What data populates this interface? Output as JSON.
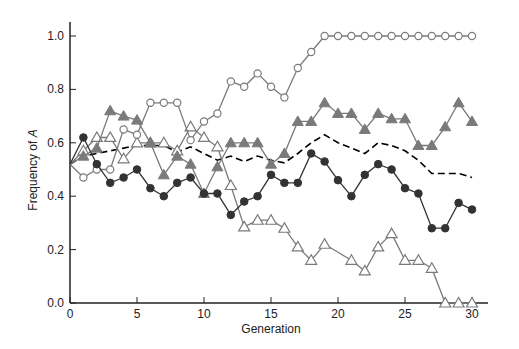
{
  "chart_data": {
    "type": "line",
    "title": "",
    "xlabel": "Generation",
    "ylabel": "Frequency of A",
    "ylabel_plain": "Frequency of ",
    "ylabel_italic": "A",
    "xlim": [
      0,
      30
    ],
    "ylim": [
      0,
      1.0
    ],
    "xticks": [
      0,
      5,
      10,
      15,
      20,
      25,
      30
    ],
    "yticks": [
      0.0,
      0.2,
      0.4,
      0.6,
      0.8,
      1.0
    ],
    "ytick_labels": [
      "0.0",
      "0.2",
      "0.4",
      "0.6",
      "0.8",
      "1.0"
    ],
    "grid": false,
    "legend": null,
    "x": [
      0,
      1,
      2,
      3,
      4,
      5,
      6,
      7,
      8,
      9,
      10,
      11,
      12,
      13,
      14,
      15,
      16,
      17,
      18,
      19,
      20,
      21,
      22,
      23,
      24,
      25,
      26,
      27,
      28,
      29,
      30
    ],
    "series": [
      {
        "name": "Population 1 (open circles)",
        "marker": "open-circle",
        "color": "#7a7a7a",
        "values": [
          0.52,
          0.47,
          0.5,
          0.5,
          0.65,
          0.63,
          0.75,
          0.75,
          0.75,
          0.61,
          0.68,
          0.71,
          0.83,
          0.81,
          0.86,
          0.81,
          0.77,
          0.88,
          0.94,
          1.0,
          1.0,
          1.0,
          1.0,
          1.0,
          1.0,
          1.0,
          1.0,
          1.0,
          1.0,
          1.0,
          1.0
        ]
      },
      {
        "name": "Population 2 (filled triangles)",
        "marker": "filled-triangle",
        "color": "#7a7a7a",
        "values": [
          0.52,
          0.55,
          0.58,
          0.72,
          0.7,
          0.685,
          0.6,
          0.48,
          0.55,
          0.52,
          0.41,
          0.51,
          0.6,
          0.6,
          0.6,
          0.52,
          0.56,
          0.68,
          0.68,
          0.75,
          0.71,
          0.71,
          0.65,
          0.71,
          0.69,
          0.69,
          0.59,
          0.59,
          0.66,
          0.75,
          0.68
        ]
      },
      {
        "name": "Population 3 (filled circles)",
        "marker": "filled-circle",
        "color": "#333333",
        "values": [
          0.52,
          0.62,
          0.52,
          0.45,
          0.47,
          0.5,
          0.43,
          0.4,
          0.45,
          0.47,
          0.41,
          0.41,
          0.33,
          0.38,
          0.4,
          0.48,
          0.45,
          0.45,
          0.56,
          0.53,
          0.46,
          0.4,
          0.48,
          0.52,
          0.5,
          0.43,
          0.41,
          0.28,
          0.28,
          0.375,
          0.35
        ]
      },
      {
        "name": "Population 4 (open triangles)",
        "marker": "open-triangle",
        "color": "#7a7a7a",
        "values": [
          0.52,
          0.57,
          0.62,
          0.62,
          0.54,
          0.6,
          0.6,
          0.6,
          0.57,
          0.66,
          0.62,
          0.585,
          0.44,
          0.285,
          0.31,
          0.31,
          0.28,
          0.21,
          0.16,
          0.22,
          0.19,
          0.16,
          0.12,
          0.21,
          0.26,
          0.16,
          0.16,
          0.13,
          0.0,
          0.0,
          0.0
        ],
        "unmarked_indices": [
          20
        ]
      },
      {
        "name": "Mean (dashed)",
        "marker": "none",
        "line_style": "dashed",
        "color": "#000000",
        "values": [
          0.52,
          0.55,
          0.56,
          0.57,
          0.58,
          0.59,
          0.59,
          0.59,
          0.565,
          0.585,
          0.56,
          0.535,
          0.55,
          0.53,
          0.55,
          0.535,
          0.525,
          0.56,
          0.6,
          0.63,
          0.6,
          0.58,
          0.56,
          0.6,
          0.59,
          0.57,
          0.535,
          0.485,
          0.485,
          0.485,
          0.47
        ]
      }
    ]
  },
  "colors": {
    "background": "#ffffff",
    "axis": "#222222",
    "gray_series": "#7a7a7a",
    "dark_series": "#333333"
  }
}
